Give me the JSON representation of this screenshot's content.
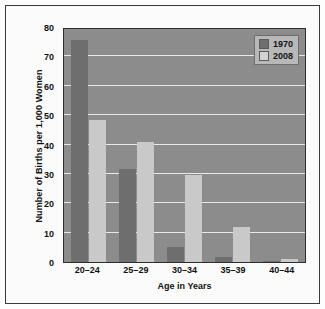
{
  "figure": {
    "frame_border_color": "#3a3a3a",
    "page_background": "#fdfdfd",
    "plot_background": "#8c8c8c",
    "gridline_color": "#e9e9e9"
  },
  "chart_data": {
    "type": "bar",
    "title": "",
    "xlabel": "Age in Years",
    "ylabel": "Number of Births per 1,000 Women",
    "categories": [
      "20–24",
      "25–29",
      "30–34",
      "35–39",
      "40–44"
    ],
    "series": [
      {
        "name": "1970",
        "color": "#6e6e6e",
        "values": [
          75.5,
          31.5,
          5.0,
          1.8,
          0.4
        ]
      },
      {
        "name": "2008",
        "color": "#c9c9c9",
        "values": [
          48.5,
          41.0,
          29.5,
          12.0,
          1.0
        ]
      }
    ],
    "ylim": [
      0,
      80
    ],
    "yticks": [
      80,
      70,
      60,
      50,
      40,
      30,
      20,
      10,
      0
    ],
    "ytick_labels": [
      "80",
      "70",
      "60",
      "50",
      "40",
      "30",
      "20",
      "10",
      "0"
    ],
    "grid": true,
    "grid_axis": "y",
    "legend": {
      "position": "top-right",
      "entries": [
        {
          "label": "1970",
          "color": "#6e6e6e"
        },
        {
          "label": "2008",
          "color": "#d2d2d2"
        }
      ]
    }
  }
}
